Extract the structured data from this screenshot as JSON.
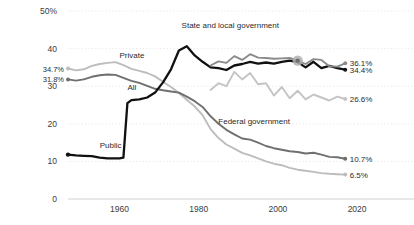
{
  "chart_data": {
    "type": "line",
    "title": "",
    "subtitle": "",
    "xlabel": "",
    "ylabel": "",
    "xlim": [
      1947,
      2018
    ],
    "ylim": [
      0,
      50
    ],
    "grid": true,
    "grid_style": "dotted-horizontal",
    "legend_position": "inline-annotations",
    "yticks": [
      "50%",
      "40",
      "30",
      "20",
      "10",
      "0"
    ],
    "ytick_values": [
      50,
      40,
      30,
      20,
      10,
      0
    ],
    "xticks": [
      "1960",
      "1980",
      "2000",
      "2020"
    ],
    "xtick_values": [
      1960,
      1980,
      2000,
      2020
    ],
    "highlight_marker": {
      "series": "State and local government",
      "x": 2005,
      "y": 36.8,
      "color": "#b0b0b0"
    },
    "series": [
      {
        "name": "Private",
        "label": "Private",
        "color": "#bdbdbd",
        "start_label": "34.7%",
        "end_label": "6.5%",
        "start_value": 34.7,
        "end_value": 6.5,
        "label_x": 1960,
        "label_y": 37.5,
        "x": [
          1947,
          1949,
          1951,
          1953,
          1955,
          1957,
          1959,
          1961,
          1963,
          1965,
          1967,
          1969,
          1971,
          1973,
          1975,
          1977,
          1979,
          1981,
          1983,
          1985,
          1987,
          1989,
          1991,
          1993,
          1995,
          1997,
          1999,
          2001,
          2003,
          2005,
          2007,
          2009,
          2011,
          2013,
          2015,
          2017
        ],
        "values": [
          34.7,
          34.2,
          34.5,
          35.4,
          35.9,
          36.2,
          36.4,
          35.6,
          34.6,
          34.1,
          33.5,
          32.6,
          31.2,
          29.8,
          28.2,
          26.4,
          24.6,
          22.3,
          18.6,
          16.2,
          14.5,
          13.4,
          12.3,
          11.6,
          10.8,
          10.0,
          9.4,
          9.0,
          8.3,
          7.8,
          7.5,
          7.2,
          6.9,
          6.7,
          6.6,
          6.5
        ]
      },
      {
        "name": "All",
        "label": "All",
        "color": "#6f6f6f",
        "start_label": "31.8%",
        "end_label": "10.7%",
        "start_value": 31.8,
        "end_value": 10.7,
        "label_x": 1962,
        "label_y": 29.0,
        "x": [
          1947,
          1949,
          1951,
          1953,
          1955,
          1957,
          1959,
          1961,
          1963,
          1965,
          1967,
          1969,
          1971,
          1973,
          1975,
          1977,
          1979,
          1981,
          1983,
          1985,
          1987,
          1989,
          1991,
          1993,
          1995,
          1997,
          1999,
          2001,
          2003,
          2005,
          2007,
          2009,
          2011,
          2013,
          2015,
          2017
        ],
        "values": [
          31.8,
          31.5,
          31.8,
          32.5,
          32.9,
          33.1,
          33.0,
          32.2,
          31.4,
          30.9,
          30.1,
          29.3,
          28.9,
          28.6,
          28.3,
          27.2,
          26.0,
          24.5,
          22.0,
          20.0,
          18.4,
          17.2,
          16.1,
          15.8,
          15.0,
          14.1,
          13.5,
          13.1,
          12.7,
          12.5,
          12.1,
          12.3,
          11.8,
          11.2,
          11.1,
          10.7
        ]
      },
      {
        "name": "Public",
        "label": "Public",
        "color": "#111111",
        "start_label": "",
        "end_label": "34.4%",
        "start_value": 11.8,
        "end_value": 34.4,
        "label_x": 1955,
        "label_y": 13.6,
        "x": [
          1947,
          1949,
          1951,
          1953,
          1955,
          1957,
          1959,
          1960,
          1961,
          1962,
          1963,
          1965,
          1967,
          1969,
          1971,
          1973,
          1975,
          1977,
          1979,
          1981,
          1983,
          1985,
          1987,
          1989,
          1991,
          1993,
          1995,
          1997,
          1999,
          2001,
          2003,
          2005,
          2007,
          2009,
          2011,
          2013,
          2015,
          2017
        ],
        "values": [
          11.8,
          11.6,
          11.5,
          11.4,
          11.0,
          10.8,
          10.8,
          10.8,
          11.0,
          25.5,
          26.3,
          26.5,
          27.0,
          28.3,
          31.0,
          34.5,
          39.5,
          40.6,
          38.2,
          36.5,
          35.0,
          34.8,
          34.3,
          35.5,
          35.9,
          36.5,
          36.0,
          36.3,
          36.0,
          36.5,
          36.8,
          36.4,
          35.0,
          36.5,
          34.8,
          35.4,
          34.8,
          34.4
        ]
      },
      {
        "name": "State and local government",
        "label": "State and local government",
        "color": "#8a8a8a",
        "start_label": "",
        "end_label": "36.1%",
        "start_value": 35.5,
        "end_value": 36.1,
        "label_x": 1988,
        "label_y": 45.5,
        "x": [
          1983,
          1985,
          1987,
          1989,
          1991,
          1993,
          1995,
          1997,
          1999,
          2001,
          2003,
          2005,
          2007,
          2009,
          2011,
          2013,
          2015,
          2017
        ],
        "values": [
          35.5,
          36.6,
          36.2,
          38.0,
          37.0,
          38.5,
          37.6,
          37.5,
          37.3,
          37.4,
          37.5,
          36.8,
          35.9,
          37.2,
          37.0,
          35.3,
          35.2,
          36.1
        ]
      },
      {
        "name": "Federal government",
        "label": "Federal government",
        "color": "#c4c4c4",
        "start_label": "",
        "end_label": "26.6%",
        "start_value": 29.0,
        "end_value": 26.6,
        "label_x": 1994,
        "label_y": 20.0,
        "x": [
          1983,
          1985,
          1987,
          1989,
          1991,
          1993,
          1995,
          1997,
          1999,
          2001,
          2003,
          2005,
          2007,
          2009,
          2011,
          2013,
          2015,
          2017
        ],
        "values": [
          29.0,
          30.8,
          30.0,
          33.8,
          31.8,
          33.5,
          30.5,
          30.8,
          27.5,
          29.8,
          26.8,
          28.8,
          26.5,
          27.8,
          27.0,
          26.2,
          27.2,
          26.6
        ]
      }
    ]
  }
}
